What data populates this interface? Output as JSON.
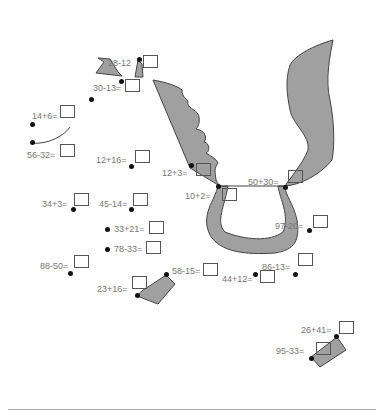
{
  "worksheet": {
    "colors": {
      "shape_fill": "#a0a0a0",
      "shape_stroke": "#444444",
      "text": "#777777",
      "dot": "#111111",
      "box_border": "#555555"
    },
    "problems": [
      {
        "id": "p1",
        "label": "28-12",
        "answer_box": true
      },
      {
        "id": "p2",
        "label": "30-13=",
        "answer_box": true
      },
      {
        "id": "p3",
        "label": "14+6=",
        "answer_box": true
      },
      {
        "id": "p4",
        "label": "56-32=",
        "answer_box": true
      },
      {
        "id": "p5",
        "label": "12+16=",
        "answer_box": true
      },
      {
        "id": "p6",
        "label": "12+3=",
        "answer_box": true
      },
      {
        "id": "p7",
        "label": "10+2=",
        "answer_box": true
      },
      {
        "id": "p8",
        "label": "50+30=",
        "answer_box": true
      },
      {
        "id": "p9",
        "label": "34+3=",
        "answer_box": true
      },
      {
        "id": "p10",
        "label": "45-14=",
        "answer_box": true
      },
      {
        "id": "p11",
        "label": "33+21=",
        "answer_box": true
      },
      {
        "id": "p12",
        "label": "78-33=",
        "answer_box": true
      },
      {
        "id": "p13",
        "label": "97-20=",
        "answer_box": true
      },
      {
        "id": "p14",
        "label": "88-50=",
        "answer_box": true
      },
      {
        "id": "p15",
        "label": "58-15=",
        "answer_box": true
      },
      {
        "id": "p16",
        "label": "86-13=",
        "answer_box": true
      },
      {
        "id": "p17",
        "label": "44+12=",
        "answer_box": true
      },
      {
        "id": "p18",
        "label": "23+16=",
        "answer_box": true
      },
      {
        "id": "p19",
        "label": "26+41=",
        "answer_box": true
      },
      {
        "id": "p20",
        "label": "95-33=",
        "answer_box": true
      }
    ]
  }
}
